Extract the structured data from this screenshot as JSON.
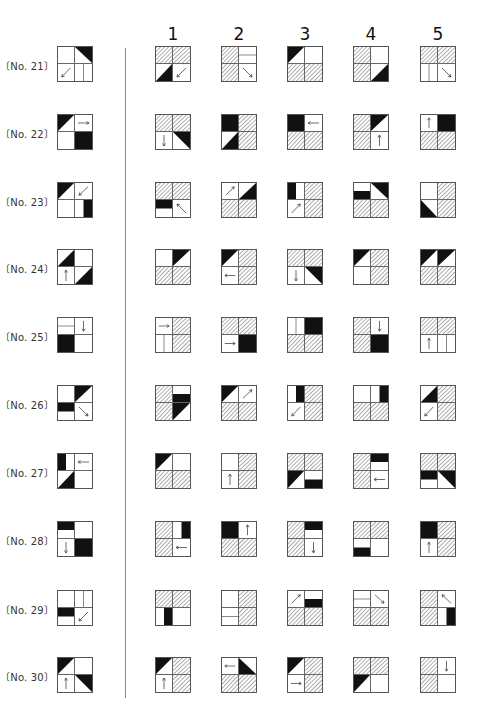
{
  "header": {
    "options": [
      "1",
      "2",
      "3",
      "4",
      "5"
    ]
  },
  "legend": {
    "cell_order": [
      "TL",
      "TR",
      "BL",
      "BR"
    ],
    "codes": {
      "e": "empty",
      "h": "hatched",
      "f": "solid black",
      "tTL": "black triangle top-left",
      "tTR": "black triangle top-right",
      "tBL": "black triangle bottom-left",
      "tBR": "black triangle bottom-right",
      "bT": "black bar top half",
      "bB": "black bar bottom half",
      "bL": "black bar left half",
      "bR": "black bar right half",
      "lH": "horizontal divider line",
      "lV": "vertical divider line",
      "aU": "arrow up",
      "aD": "arrow down",
      "aL": "arrow left",
      "aR": "arrow right",
      "aUR": "arrow up-right",
      "aUL": "arrow up-left",
      "aDR": "arrow down-right",
      "aDL": "arrow down-left"
    }
  },
  "problems": [
    {
      "label": "〔No. 21〕",
      "stem": [
        "e",
        "tTR",
        "aDL",
        "lV"
      ],
      "options": [
        [
          "h",
          "h",
          "tBR",
          "aDL"
        ],
        [
          "h",
          "lH",
          "h",
          "aDR"
        ],
        [
          "tTL",
          "e",
          "h",
          "h"
        ],
        [
          "h",
          "e",
          "h",
          "tBR"
        ],
        [
          "h",
          "h",
          "lV",
          "aDR"
        ]
      ]
    },
    {
      "label": "〔No. 22〕",
      "stem": [
        "tTL",
        "aR",
        "e",
        "f"
      ],
      "options": [
        [
          "h",
          "h",
          "aD",
          "tTR"
        ],
        [
          "f",
          "h",
          "tBR",
          "h"
        ],
        [
          "f",
          "aL",
          "h",
          "h"
        ],
        [
          "h",
          "tTL",
          "h",
          "aU"
        ],
        [
          "aU",
          "f",
          "h",
          "h"
        ]
      ]
    },
    {
      "label": "〔No. 23〕",
      "stem": [
        "tTL",
        "aDL",
        "e",
        "bR"
      ],
      "options": [
        [
          "h",
          "h",
          "bT",
          "aUL"
        ],
        [
          "aUR",
          "tBR",
          "h",
          "h"
        ],
        [
          "bL",
          "h",
          "aUR",
          "h"
        ],
        [
          "bB",
          "tTR",
          "h",
          "h"
        ],
        [
          "e",
          "h",
          "tBL",
          "h"
        ]
      ]
    },
    {
      "label": "〔No. 24〕",
      "stem": [
        "tBR",
        "e",
        "aU",
        "tBR"
      ],
      "options": [
        [
          "e",
          "tTL",
          "h",
          "h"
        ],
        [
          "tTL",
          "h",
          "aL",
          "h"
        ],
        [
          "h",
          "h",
          "aD",
          "tTR"
        ],
        [
          "tTL",
          "h",
          "e",
          "h"
        ],
        [
          "tTL",
          "tTL",
          "h",
          "h"
        ]
      ]
    },
    {
      "label": "〔No. 25〕",
      "stem": [
        "lH",
        "aD",
        "f",
        "e"
      ],
      "options": [
        [
          "aR",
          "h",
          "lV",
          "h"
        ],
        [
          "h",
          "h",
          "aR",
          "f"
        ],
        [
          "lV",
          "f",
          "h",
          "h"
        ],
        [
          "h",
          "aD",
          "h",
          "f"
        ],
        [
          "h",
          "h",
          "aU",
          "lV"
        ]
      ]
    },
    {
      "label": "〔No. 26〕",
      "stem": [
        "e",
        "tTL",
        "bT",
        "aDR"
      ],
      "options": [
        [
          "h",
          "bB",
          "h",
          "tTL"
        ],
        [
          "tTL",
          "aUR",
          "h",
          "h"
        ],
        [
          "bR",
          "h",
          "aDL",
          "h"
        ],
        [
          "e",
          "bR",
          "h",
          "h"
        ],
        [
          "tBR",
          "h",
          "aDL",
          "h"
        ]
      ]
    },
    {
      "label": "〔No. 27〕",
      "stem": [
        "bL",
        "aL",
        "tBR",
        "e"
      ],
      "options": [
        [
          "tTL",
          "e",
          "h",
          "h"
        ],
        [
          "e",
          "h",
          "aU",
          "h"
        ],
        [
          "h",
          "h",
          "tTL",
          "bB"
        ],
        [
          "h",
          "bT",
          "h",
          "aL"
        ],
        [
          "h",
          "h",
          "bT",
          "tTR"
        ]
      ]
    },
    {
      "label": "〔No. 28〕",
      "stem": [
        "bT",
        "e",
        "aD",
        "f"
      ],
      "options": [
        [
          "h",
          "bR",
          "h",
          "aL"
        ],
        [
          "f",
          "aU",
          "h",
          "h"
        ],
        [
          "h",
          "bT",
          "h",
          "aD"
        ],
        [
          "h",
          "h",
          "bB",
          "e"
        ],
        [
          "f",
          "h",
          "aU",
          "h"
        ]
      ]
    },
    {
      "label": "〔No. 29〕",
      "stem": [
        "e",
        "lV",
        "bT",
        "aDL"
      ],
      "options": [
        [
          "h",
          "h",
          "bR",
          "e"
        ],
        [
          "e",
          "h",
          "lH",
          "h"
        ],
        [
          "aUR",
          "bB",
          "h",
          "h"
        ],
        [
          "lH",
          "aDR",
          "h",
          "h"
        ],
        [
          "h",
          "aUL",
          "h",
          "bR"
        ]
      ]
    },
    {
      "label": "〔No. 30〕",
      "stem": [
        "tTL",
        "e",
        "aU",
        "tTR"
      ],
      "options": [
        [
          "tTL",
          "h",
          "aU",
          "h"
        ],
        [
          "aL",
          "tBL",
          "h",
          "h"
        ],
        [
          "tTL",
          "h",
          "aR",
          "h"
        ],
        [
          "h",
          "h",
          "tTL",
          "e"
        ],
        [
          "h",
          "aD",
          "h",
          "e"
        ]
      ]
    }
  ]
}
